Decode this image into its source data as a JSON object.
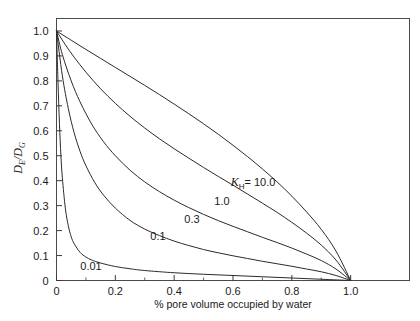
{
  "chart_data": {
    "type": "line",
    "title": "",
    "xlabel": "% pore volume occupied by water",
    "ylabel": "D_E/D_G",
    "ylabel_parts": {
      "num_var": "D",
      "num_sub": "E",
      "slash": "/",
      "den_var": "D",
      "den_sub": "G"
    },
    "xlim": [
      0,
      1.2
    ],
    "ylim": [
      0,
      1.05
    ],
    "grid": false,
    "legend_position": "inline-annotations",
    "xticks": [
      0,
      0.2,
      0.4,
      0.6,
      0.8,
      1.0
    ],
    "xticklabels": [
      "0",
      "0.2",
      "0.4",
      "0.6",
      "0.8",
      "1.0"
    ],
    "xticks_minor": [
      0.1,
      0.3,
      0.5,
      0.7,
      0.9
    ],
    "yticks": [
      0,
      0.1,
      0.2,
      0.3,
      0.4,
      0.5,
      0.6,
      0.7,
      0.8,
      0.9,
      1.0
    ],
    "yticklabels": [
      "0",
      "0.1",
      "0.2",
      "0.3",
      "0.4",
      "0.5",
      "0.6",
      "0.7",
      "0.8",
      "0.9",
      "1.0"
    ],
    "series": [
      {
        "name": "0.01",
        "kh": 0.01,
        "label": "0.01",
        "label_x": 0.115,
        "label_y": 0.105,
        "x": [
          0.0,
          0.005,
          0.01,
          0.015,
          0.02,
          0.03,
          0.04,
          0.05,
          0.06,
          0.08,
          0.1,
          0.12,
          0.15,
          0.2,
          0.25,
          0.3,
          0.4,
          0.5,
          0.6,
          0.7,
          0.8,
          0.9,
          1.0
        ],
        "y": [
          1.0,
          0.8,
          0.63,
          0.5,
          0.41,
          0.29,
          0.22,
          0.175,
          0.148,
          0.113,
          0.094,
          0.082,
          0.07,
          0.056,
          0.047,
          0.04,
          0.031,
          0.025,
          0.02,
          0.015,
          0.01,
          0.005,
          0.0
        ]
      },
      {
        "name": "0.1",
        "kh": 0.1,
        "label": "0.1",
        "label_x": 0.345,
        "label_y": 0.215,
        "x": [
          0.0,
          0.02,
          0.04,
          0.06,
          0.08,
          0.1,
          0.13,
          0.16,
          0.2,
          0.25,
          0.3,
          0.35,
          0.4,
          0.45,
          0.5,
          0.55,
          0.6,
          0.65,
          0.7,
          0.75,
          0.8,
          0.85,
          0.9,
          0.95,
          1.0
        ],
        "y": [
          1.0,
          0.82,
          0.69,
          0.592,
          0.518,
          0.46,
          0.393,
          0.342,
          0.29,
          0.241,
          0.206,
          0.18,
          0.158,
          0.14,
          0.124,
          0.111,
          0.099,
          0.088,
          0.077,
          0.067,
          0.057,
          0.046,
          0.035,
          0.02,
          0.0
        ]
      },
      {
        "name": "0.3",
        "kh": 0.3,
        "label": "0.3",
        "label_x": 0.455,
        "label_y": 0.282,
        "x": [
          0.0,
          0.02,
          0.05,
          0.08,
          0.12,
          0.16,
          0.2,
          0.25,
          0.3,
          0.35,
          0.4,
          0.45,
          0.5,
          0.55,
          0.6,
          0.65,
          0.7,
          0.75,
          0.8,
          0.85,
          0.9,
          0.95,
          1.0
        ],
        "y": [
          1.0,
          0.905,
          0.8,
          0.716,
          0.626,
          0.556,
          0.5,
          0.442,
          0.395,
          0.356,
          0.322,
          0.292,
          0.265,
          0.24,
          0.217,
          0.195,
          0.173,
          0.152,
          0.13,
          0.106,
          0.08,
          0.046,
          0.0
        ]
      },
      {
        "name": "1.0",
        "kh": 1.0,
        "label": "1.0",
        "label_x": 0.565,
        "label_y": 0.352,
        "x": [
          0.0,
          0.03,
          0.06,
          0.1,
          0.15,
          0.2,
          0.25,
          0.3,
          0.35,
          0.4,
          0.45,
          0.5,
          0.55,
          0.6,
          0.65,
          0.7,
          0.75,
          0.8,
          0.85,
          0.9,
          0.95,
          1.0
        ],
        "y": [
          1.0,
          0.945,
          0.895,
          0.835,
          0.768,
          0.71,
          0.658,
          0.611,
          0.568,
          0.528,
          0.49,
          0.453,
          0.417,
          0.382,
          0.346,
          0.31,
          0.273,
          0.233,
          0.19,
          0.142,
          0.082,
          0.0
        ]
      },
      {
        "name": "10.0",
        "kh": 10.0,
        "label": "10.0",
        "label_prefix": "K",
        "label_sub": "H",
        "label_eq": " =  ",
        "label_x": 0.655,
        "label_y": 0.425,
        "x": [
          0.0,
          0.05,
          0.1,
          0.15,
          0.2,
          0.25,
          0.3,
          0.35,
          0.4,
          0.45,
          0.5,
          0.55,
          0.6,
          0.65,
          0.7,
          0.75,
          0.8,
          0.85,
          0.9,
          0.95,
          1.0
        ],
        "y": [
          1.0,
          0.963,
          0.926,
          0.89,
          0.854,
          0.818,
          0.782,
          0.745,
          0.707,
          0.668,
          0.628,
          0.586,
          0.542,
          0.496,
          0.447,
          0.395,
          0.338,
          0.275,
          0.205,
          0.118,
          0.0
        ]
      }
    ],
    "annotations": [
      {
        "text": "K_H = 10.0",
        "x": 0.655,
        "y": 0.425
      },
      {
        "text": "1.0",
        "x": 0.565,
        "y": 0.352
      },
      {
        "text": "0.3",
        "x": 0.455,
        "y": 0.282
      },
      {
        "text": "0.1",
        "x": 0.345,
        "y": 0.215
      },
      {
        "text": "0.01",
        "x": 0.115,
        "y": 0.105
      }
    ]
  },
  "labels": {
    "xaxis_title": "% pore volume occupied by water",
    "kh_var": "K",
    "kh_sub": "H",
    "kh_eq": "= 10.0",
    "l_1p0": "1.0",
    "l_0p3": "0.3",
    "l_0p1": "0.1",
    "l_0p01": "0.01",
    "y_num": "D",
    "y_num_sub": "E",
    "y_slash": "/",
    "y_den": "D",
    "y_den_sub": "G"
  },
  "colors": {
    "curve": "#2b2b2b",
    "axis": "#3a3a3a",
    "frame": "#4a4a4a",
    "text": "#1a1a1a",
    "background": "#ffffff"
  }
}
